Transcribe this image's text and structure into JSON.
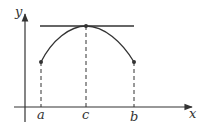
{
  "diagram": {
    "axes": {
      "x_label": "x",
      "y_label": "y"
    },
    "points": [
      {
        "name": "a",
        "label": "a"
      },
      {
        "name": "c",
        "label": "c"
      },
      {
        "name": "b",
        "label": "b"
      }
    ],
    "elements": [
      "curve f(x) from a to b with maximum at c",
      "horizontal tangent at c",
      "dashed verticals at a, c, b"
    ],
    "colors": {
      "stroke": "#333333",
      "background": "#ffffff"
    }
  }
}
